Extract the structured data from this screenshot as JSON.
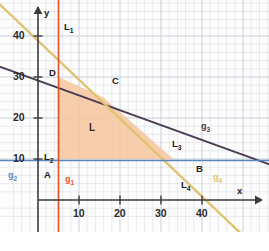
{
  "figure": {
    "kind": "linear-programming-feasible-region",
    "axes": {
      "x_axis_label": "x",
      "y_axis_label": "y",
      "x_ticks": [
        {
          "value": 10,
          "label": "10"
        },
        {
          "value": 20,
          "label": "20"
        },
        {
          "value": 30,
          "label": "30"
        },
        {
          "value": 40,
          "label": "40"
        }
      ],
      "y_ticks": [
        {
          "value": 10,
          "label": "10"
        },
        {
          "value": 20,
          "label": "20"
        },
        {
          "value": 30,
          "label": "30"
        },
        {
          "value": 40,
          "label": "40"
        }
      ],
      "x_range": [
        -6,
        48
      ],
      "y_range": [
        -10,
        48
      ],
      "grid": "minor every 2 units, major every 10 units"
    },
    "lines": [
      {
        "name": "g1",
        "label": "g",
        "label_sub": "1",
        "constraint_label": "L",
        "constraint_sub": "1",
        "kind": "vertical",
        "x": 5,
        "color": "#e8542a",
        "label_pos": {
          "x": 65,
          "y": 175
        },
        "constraint_pos": {
          "x": 64,
          "y": 22
        }
      },
      {
        "name": "g2",
        "label": "g",
        "label_sub": "2",
        "constraint_label": "L",
        "constraint_sub": "2",
        "kind": "horizontal",
        "y": 10,
        "color": "#5b86bd",
        "label_pos": {
          "x": 8,
          "y": 171
        },
        "constraint_pos": {
          "x": 44,
          "y": 152
        }
      },
      {
        "name": "g3",
        "label": "g",
        "label_sub": "3",
        "constraint_label": "L",
        "constraint_sub": "3",
        "kind": "oblique",
        "from": {
          "x": -6,
          "y": 33
        },
        "to": {
          "x": 48,
          "y": 14
        },
        "color": "#4a3a52",
        "label_pos": {
          "x": 201,
          "y": 122
        },
        "constraint_pos": {
          "x": 172,
          "y": 139
        }
      },
      {
        "name": "g4",
        "label": "g",
        "label_sub": "4",
        "constraint_label": "L",
        "constraint_sub": "4",
        "kind": "oblique",
        "from": {
          "x": -6,
          "y": 47
        },
        "to": {
          "x": 48,
          "y": -8
        },
        "color": "#e0c272",
        "label_pos": {
          "x": 213,
          "y": 173
        },
        "constraint_pos": {
          "x": 181,
          "y": 180
        }
      }
    ],
    "region": {
      "label": "L",
      "label_pos": {
        "x": 89,
        "y": 123
      },
      "fill": "#f6c7a0",
      "vertices": [
        {
          "name": "A",
          "x": 5,
          "y": 10
        },
        {
          "name": "B",
          "x": 33,
          "y": 10
        },
        {
          "name": "C",
          "x": 16,
          "y": 25
        },
        {
          "name": "D",
          "x": 5,
          "y": 30
        }
      ]
    },
    "points": [
      {
        "label": "A",
        "pos": {
          "x": 44,
          "y": 170
        }
      },
      {
        "label": "B",
        "pos": {
          "x": 196,
          "y": 164
        }
      },
      {
        "label": "C",
        "pos": {
          "x": 112,
          "y": 76
        }
      },
      {
        "label": "D",
        "pos": {
          "x": 49,
          "y": 68
        }
      }
    ],
    "colors": {
      "g1": "#e8542a",
      "g2": "#5b86bd",
      "g3": "#4a3a52",
      "g4": "#e0c272",
      "region_fill": "#f6c7a0",
      "axis": "#3a3a3a",
      "grid_minor": "#dfe3ea",
      "grid_major": "#c3c9d4",
      "background": "#fdfdfd"
    }
  }
}
